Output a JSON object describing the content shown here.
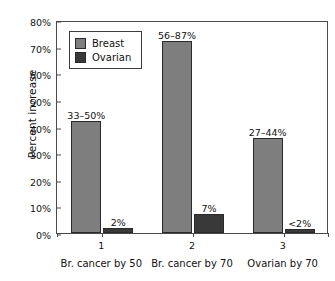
{
  "chart_data": {
    "type": "bar",
    "title": "",
    "xlabel": "",
    "ylabel": "Percent increase",
    "ylim": [
      0,
      80
    ],
    "ytick_labels": [
      "0%",
      "10%",
      "20%",
      "30%",
      "40%",
      "50%",
      "60%",
      "70%",
      "80%"
    ],
    "ytick_values": [
      0,
      10,
      20,
      30,
      40,
      50,
      60,
      70,
      80
    ],
    "grid": false,
    "legend_position": "upper left",
    "categories": [
      "Br. cancer by 50",
      "Br. cancer by 70",
      "Ovarian by 70"
    ],
    "group_numbers": [
      "1",
      "2",
      "3"
    ],
    "series": [
      {
        "name": "Breast",
        "color": "#7e7e7e",
        "values": [
          42,
          72,
          35.5
        ],
        "data_labels": [
          "33–50%",
          "56–87%",
          "27–44%"
        ]
      },
      {
        "name": "Ovarian",
        "color": "#393939",
        "values": [
          2,
          7,
          1.5
        ],
        "data_labels": [
          "2%",
          "7%",
          "<2%"
        ]
      }
    ]
  },
  "legend": {
    "items": [
      {
        "label": "Breast",
        "swatch": "breast"
      },
      {
        "label": "Ovarian",
        "swatch": "ovarian"
      }
    ]
  }
}
